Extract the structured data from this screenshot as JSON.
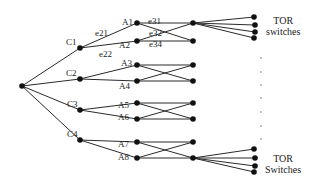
{
  "diagram": {
    "type": "network-topology-tree",
    "colors": {
      "line": "#2a2a2a",
      "node": "#111111",
      "background": "#ffffff"
    },
    "root": {
      "x": 22,
      "y": 86
    },
    "core_nodes": [
      {
        "id": "C1",
        "label": "C1",
        "x": 80,
        "y": 48
      },
      {
        "id": "C2",
        "label": "C2",
        "x": 80,
        "y": 79
      },
      {
        "id": "C3",
        "label": "C3",
        "x": 80,
        "y": 110
      },
      {
        "id": "C4",
        "label": "C4",
        "x": 80,
        "y": 140
      }
    ],
    "agg_nodes": [
      {
        "id": "A1",
        "label": "A1",
        "x": 137,
        "y": 23
      },
      {
        "id": "A2",
        "label": "A2",
        "x": 137,
        "y": 41
      },
      {
        "id": "A3",
        "label": "A3",
        "x": 137,
        "y": 65
      },
      {
        "id": "A4",
        "label": "A4",
        "x": 137,
        "y": 81
      },
      {
        "id": "A5",
        "label": "A5",
        "x": 137,
        "y": 103
      },
      {
        "id": "A6",
        "label": "A6",
        "x": 137,
        "y": 119
      },
      {
        "id": "A7",
        "label": "A7",
        "x": 137,
        "y": 142
      },
      {
        "id": "A8",
        "label": "A8",
        "x": 137,
        "y": 158
      }
    ],
    "edge_nodes": [
      {
        "x": 193,
        "y": 23
      },
      {
        "x": 193,
        "y": 41
      },
      {
        "x": 193,
        "y": 65
      },
      {
        "x": 193,
        "y": 81
      },
      {
        "x": 193,
        "y": 103
      },
      {
        "x": 193,
        "y": 119
      },
      {
        "x": 193,
        "y": 142
      },
      {
        "x": 193,
        "y": 158
      }
    ],
    "tor_top": {
      "from": {
        "x": 193,
        "y": 23
      },
      "nodes": [
        {
          "x": 254,
          "y": 17
        },
        {
          "x": 255,
          "y": 25
        },
        {
          "x": 255,
          "y": 32
        },
        {
          "x": 254,
          "y": 38
        }
      ]
    },
    "tor_bottom": {
      "from": {
        "x": 193,
        "y": 158
      },
      "nodes": [
        {
          "x": 254,
          "y": 149
        },
        {
          "x": 255,
          "y": 158
        },
        {
          "x": 255,
          "y": 166
        },
        {
          "x": 254,
          "y": 172
        }
      ]
    },
    "ellipsis_dots": [
      {
        "x": 261,
        "y": 58
      },
      {
        "x": 261,
        "y": 72
      },
      {
        "x": 261,
        "y": 85
      },
      {
        "x": 261,
        "y": 98
      },
      {
        "x": 261,
        "y": 112
      },
      {
        "x": 261,
        "y": 126
      },
      {
        "x": 261,
        "y": 139
      }
    ],
    "edge_labels": {
      "e21": "e21",
      "e22": "e22",
      "e31": "e31",
      "e32": "e32",
      "e34": "e34"
    },
    "tor_labels": {
      "top": {
        "line1": "TOR",
        "line2": "switches"
      },
      "bottom": {
        "line1": "TOR",
        "line2": "Switches"
      }
    }
  }
}
